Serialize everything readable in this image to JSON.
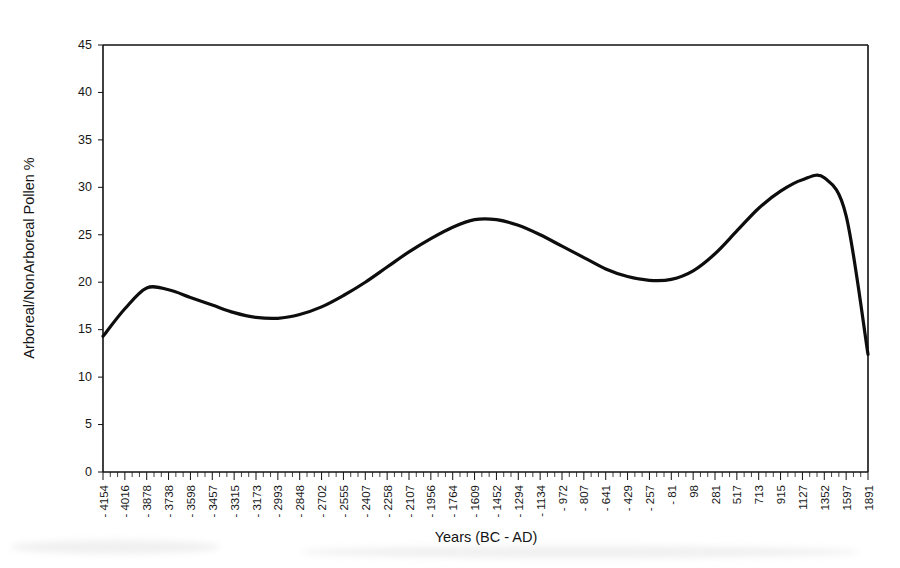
{
  "chart_data": {
    "type": "line",
    "title": "",
    "xlabel": "Years (BC - AD)",
    "ylabel": "Arboreal/NonArboreal Pollen %",
    "ylim": [
      0,
      45
    ],
    "yticks": [
      0,
      5,
      10,
      15,
      20,
      25,
      30,
      35,
      40,
      45
    ],
    "grid": false,
    "legend": "none",
    "categories": [
      "-4154",
      "-4016",
      "-3878",
      "-3738",
      "-3598",
      "-3457",
      "-3315",
      "-3173",
      "-2993",
      "-2848",
      "-2702",
      "-2555",
      "-2407",
      "-2258",
      "-2107",
      "-1956",
      "-1764",
      "-1609",
      "-1452",
      "-1294",
      "-1134",
      "-972",
      "-807",
      "-641",
      "-429",
      "-257",
      "-81",
      "98",
      "281",
      "517",
      "713",
      "915",
      "1127",
      "1352",
      "1597",
      "1891"
    ],
    "series": [
      {
        "name": "Arboreal/NonArboreal Pollen %",
        "values": [
          14.3,
          17.2,
          19.4,
          19.2,
          18.4,
          17.6,
          16.8,
          16.3,
          16.2,
          16.6,
          17.4,
          18.6,
          20.0,
          21.6,
          23.2,
          24.6,
          25.8,
          26.6,
          26.6,
          26.0,
          25.0,
          23.8,
          22.6,
          21.4,
          20.6,
          20.2,
          20.3,
          21.2,
          23.0,
          25.4,
          27.8,
          29.6,
          30.8,
          31.0,
          27.0,
          12.4
        ]
      }
    ],
    "annotations": {
      "start_value": 14.3,
      "first_peak": 19.5,
      "first_trough": 16.2,
      "second_peak": 26.7,
      "second_trough": 20.3,
      "third_peak": 31.0,
      "end_value": 12.4
    }
  },
  "axes": {
    "y_title": "Arboreal/NonArboreal Pollen %",
    "x_title": "Years (BC - AD)"
  }
}
